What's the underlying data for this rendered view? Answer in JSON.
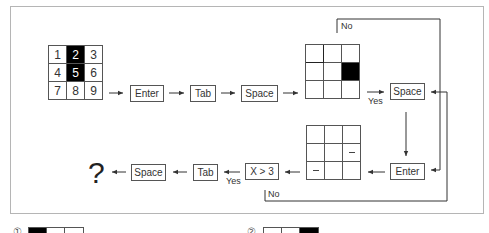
{
  "diagram": {
    "start_grid": {
      "cells": [
        "1",
        "2",
        "3",
        "4",
        "5",
        "6",
        "7",
        "8",
        "9"
      ],
      "filled": [
        false,
        true,
        false,
        false,
        true,
        false,
        false,
        false,
        false
      ]
    },
    "top_flow": [
      "Enter",
      "Tab",
      "Space"
    ],
    "middle_grid": {
      "filled": [
        false,
        false,
        false,
        false,
        false,
        true,
        false,
        false,
        false
      ]
    },
    "decision_top": {
      "yes_label": "Yes",
      "no_label": "No"
    },
    "right_space_label": "Space",
    "right_enter_label": "Enter",
    "bottom_grid": {
      "marks": [
        "",
        "",
        "",
        "",
        "",
        "–",
        "–",
        "",
        ""
      ]
    },
    "condition_label": "X > 3",
    "decision_bottom": {
      "yes_label": "Yes",
      "no_label": "No"
    },
    "bottom_flow": [
      "Tab",
      "Space"
    ],
    "result_label": "?"
  },
  "options": [
    {
      "number": "①",
      "filled": [
        true,
        false,
        false
      ]
    },
    {
      "number": "②",
      "filled": [
        false,
        false,
        true
      ]
    }
  ]
}
